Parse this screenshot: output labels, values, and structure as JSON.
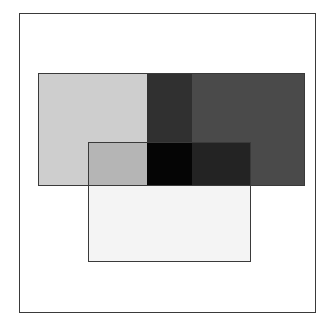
{
  "figure": {
    "canvas_width": 336,
    "canvas_height": 335,
    "background_color": "#FFFFFF"
  },
  "outer_frame": {
    "label": "outer-border",
    "x": 19,
    "y": 13,
    "width": 297,
    "height": 300,
    "stroke_color": "#3A3A3A",
    "stroke_width": 1,
    "fill_color": "none"
  },
  "rectangles": [
    {
      "label": "upper-wide-rectangle",
      "x": 38,
      "y": 73,
      "width": 267,
      "height": 113,
      "stroke_color": "#3A3A3A",
      "stroke_width": 1
    },
    {
      "label": "lower-rectangle",
      "x": 88,
      "y": 142,
      "width": 163,
      "height": 120,
      "stroke_color": "#3A3A3A",
      "stroke_width": 1
    }
  ],
  "regions": [
    {
      "label": "upper-left-light-gray",
      "x": 38,
      "y": 73,
      "width": 109,
      "height": 113,
      "color": "#CECECE"
    },
    {
      "label": "upper-middle-dark",
      "x": 147,
      "y": 73,
      "width": 45,
      "height": 113,
      "color": "#303030"
    },
    {
      "label": "upper-right-medium-dark",
      "x": 192,
      "y": 73,
      "width": 113,
      "height": 113,
      "color": "#4A4A4A"
    },
    {
      "label": "overlap-left-medium-gray",
      "x": 88,
      "y": 142,
      "width": 59,
      "height": 44,
      "color": "#B5B5B5"
    },
    {
      "label": "overlap-center-black",
      "x": 147,
      "y": 142,
      "width": 45,
      "height": 44,
      "color": "#050505"
    },
    {
      "label": "overlap-right-very-dark",
      "x": 192,
      "y": 142,
      "width": 59,
      "height": 44,
      "color": "#232323"
    },
    {
      "label": "lower-only-near-white",
      "x": 88,
      "y": 186,
      "width": 163,
      "height": 76,
      "color": "#F4F4F4"
    }
  ],
  "edges": [
    {
      "label": "upper-rect-outline",
      "x": 38,
      "y": 73,
      "width": 267,
      "height": 113,
      "color": "#3A3A3A"
    },
    {
      "label": "lower-rect-outline",
      "x": 88,
      "y": 142,
      "width": 163,
      "height": 120,
      "color": "#3A3A3A"
    }
  ],
  "chart_data": {
    "type": "area",
    "xlabel": "",
    "ylabel": "",
    "xlim": [
      0,
      336
    ],
    "ylim": [
      0,
      335
    ],
    "grid": false,
    "legend": "none",
    "shapes": [
      {
        "name": "upper-wide-rectangle",
        "kind": "rectangle",
        "x": 38,
        "y": 73,
        "width": 267,
        "height": 113,
        "base_fill": "#4A4A4A",
        "edge_color": "#3A3A3A",
        "z": 1
      },
      {
        "name": "lower-rectangle",
        "kind": "rectangle",
        "x": 88,
        "y": 142,
        "width": 163,
        "height": 120,
        "base_fill": "#F4F4F4",
        "edge_color": "#3A3A3A",
        "z": 2
      }
    ],
    "observed_region_colors": [
      {
        "region": "upper-left",
        "color": "#CECECE"
      },
      {
        "region": "upper-middle",
        "color": "#303030"
      },
      {
        "region": "upper-right",
        "color": "#4A4A4A"
      },
      {
        "region": "overlap-left",
        "color": "#B5B5B5"
      },
      {
        "region": "overlap-center",
        "color": "#050505"
      },
      {
        "region": "overlap-right",
        "color": "#232323"
      },
      {
        "region": "lower-only",
        "color": "#F4F4F4"
      }
    ],
    "vertical_band_breaks_x": [
      38,
      147,
      192,
      305
    ],
    "horizontal_band_breaks_y": [
      73,
      142,
      186,
      262
    ]
  }
}
